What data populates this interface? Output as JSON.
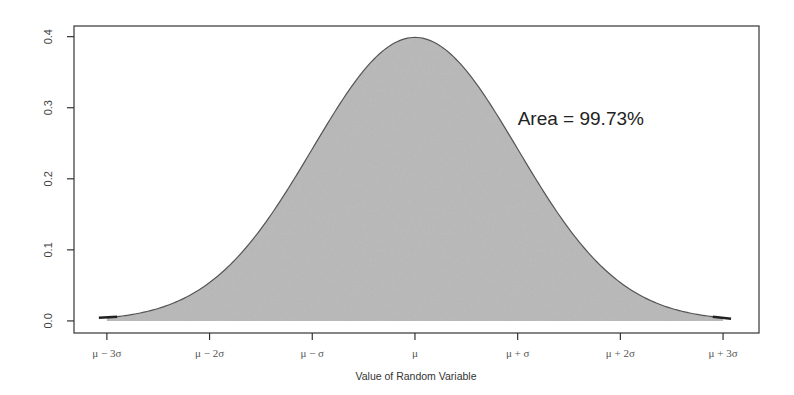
{
  "chart_data": {
    "type": "area",
    "title": "",
    "xlabel": "Value of Random Variable",
    "ylabel": "",
    "x_tick_labels": [
      "μ − 3σ",
      "μ − 2σ",
      "μ − σ",
      "μ",
      "μ + σ",
      "μ + 2σ",
      "μ + 3σ"
    ],
    "x_tick_values": [
      -3,
      -2,
      -1,
      0,
      1,
      2,
      3
    ],
    "y_tick_labels": [
      "0.0",
      "0.1",
      "0.2",
      "0.3",
      "0.4"
    ],
    "y_tick_values": [
      0.0,
      0.1,
      0.2,
      0.3,
      0.4
    ],
    "xlim": [
      -3.32,
      3.35
    ],
    "ylim": [
      -0.017,
      0.415
    ],
    "grid": false,
    "series": [
      {
        "name": "Standard normal density",
        "distribution": "normal",
        "mean": 0,
        "sd": 1,
        "shaded_from": -3,
        "shaded_to": 3,
        "x": [
          -3,
          -2.5,
          -2,
          -1.5,
          -1,
          -0.5,
          0,
          0.5,
          1,
          1.5,
          2,
          2.5,
          3
        ],
        "values": [
          0.0044,
          0.0175,
          0.054,
          0.1295,
          0.242,
          0.352,
          0.3989,
          0.352,
          0.242,
          0.1295,
          0.054,
          0.0175,
          0.0044
        ]
      }
    ],
    "annotations": [
      {
        "text": "Area = 99.73%",
        "x": 1.0,
        "y": 0.285
      }
    ],
    "colors": {
      "fill": "#b4b4b4",
      "line": "#555555",
      "frame": "#444444"
    }
  }
}
